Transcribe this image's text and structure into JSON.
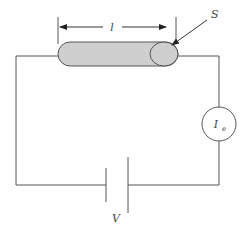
{
  "diagram": {
    "title": "",
    "labels": {
      "length": "l",
      "surface": "S",
      "current_symbol": "I",
      "current_subscript": "e",
      "voltage": "V"
    },
    "components": [
      {
        "type": "rod",
        "name": "cylindrical sample",
        "dimension_label": "l",
        "end_face_label": "S"
      },
      {
        "type": "ammeter",
        "label": "I_e"
      },
      {
        "type": "battery",
        "label": "V"
      }
    ],
    "colors": {
      "rod_fill": "#cfcfcf",
      "line": "#555555",
      "background": "#ffffff"
    }
  }
}
